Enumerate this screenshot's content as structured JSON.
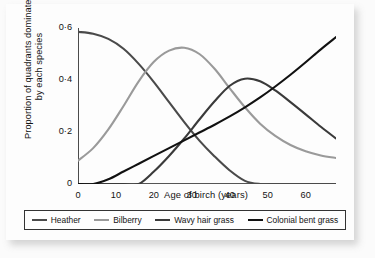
{
  "chart_data": {
    "type": "line",
    "title": "",
    "xlabel": "Age of birch (years)",
    "ylabel": "Proportion of quadrants dominated by each species",
    "xlim": [
      0,
      68
    ],
    "ylim": [
      0,
      0.6
    ],
    "xticks": [
      "0",
      "10",
      "20",
      "30",
      "40",
      "50",
      "60"
    ],
    "xtick_values": [
      0,
      10,
      20,
      30,
      40,
      50,
      60
    ],
    "yticks": [
      "0",
      "0·2",
      "0·4",
      "0·6"
    ],
    "ytick_values": [
      0,
      0.2,
      0.4,
      0.6
    ],
    "grid": false,
    "legend_position": "bottom",
    "x": [
      0,
      4,
      8,
      12,
      16,
      20,
      24,
      28,
      32,
      36,
      40,
      44,
      48,
      52,
      56,
      60,
      64,
      68
    ],
    "series": [
      {
        "name": "Heather",
        "color": "#4a4a4a",
        "values": [
          0.585,
          0.578,
          0.558,
          0.52,
          0.462,
          0.392,
          0.315,
          0.238,
          0.167,
          0.106,
          0.052,
          0.012,
          0.0,
          0.0,
          0.0,
          0.0,
          0.0,
          0.0
        ]
      },
      {
        "name": "Bilberry",
        "color": "#9a9a9a",
        "values": [
          0.09,
          0.138,
          0.21,
          0.3,
          0.395,
          0.47,
          0.513,
          0.524,
          0.5,
          0.443,
          0.368,
          0.295,
          0.232,
          0.185,
          0.15,
          0.126,
          0.11,
          0.1
        ]
      },
      {
        "name": "Wavy hair grass",
        "color": "#3a3a3a",
        "values": [
          0.0,
          0.0,
          0.0,
          0.0,
          0.0,
          0.048,
          0.108,
          0.175,
          0.248,
          0.318,
          0.378,
          0.405,
          0.395,
          0.36,
          0.315,
          0.268,
          0.22,
          0.175
        ]
      },
      {
        "name": "Colonial bent grass",
        "color": "#111111",
        "values": [
          0.0,
          0.0,
          0.018,
          0.048,
          0.078,
          0.108,
          0.138,
          0.168,
          0.198,
          0.228,
          0.26,
          0.295,
          0.333,
          0.375,
          0.42,
          0.468,
          0.518,
          0.565
        ]
      }
    ]
  },
  "legend": {
    "items": [
      {
        "label": "Heather",
        "color": "#4a4a4a"
      },
      {
        "label": "Bilberry",
        "color": "#9a9a9a"
      },
      {
        "label": "Wavy hair grass",
        "color": "#3a3a3a"
      },
      {
        "label": "Colonial bent grass",
        "color": "#111111"
      }
    ]
  }
}
